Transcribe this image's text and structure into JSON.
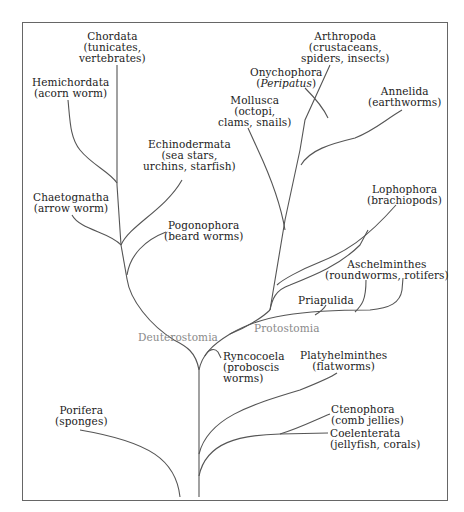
{
  "diagram": {
    "type": "phylogenetic-tree",
    "groups": {
      "deuterostomia": "Deuterostomia",
      "protostomia": "Protostomia"
    },
    "taxa": {
      "chordata": {
        "name": "Chordata",
        "common1": "(tunicates,",
        "common2": "vertebrates)"
      },
      "hemichordata": {
        "name": "Hemichordata",
        "common1": "(acorn worm)"
      },
      "echinodermata": {
        "name": "Echinodermata",
        "common1": "(sea stars,",
        "common2": "urchins, starfish)"
      },
      "chaetognatha": {
        "name": "Chaetognatha",
        "common1": "(arrow worm)"
      },
      "pogonophora": {
        "name": "Pogonophora",
        "common1": "(beard worms)"
      },
      "arthropoda": {
        "name": "Arthropoda",
        "common1": "(crustaceans,",
        "common2": "spiders, insects)"
      },
      "onychophora": {
        "name": "Onychophora",
        "common_open": "(",
        "common_italic": "Peripatus",
        "common_close": ")"
      },
      "mollusca": {
        "name": "Mollusca",
        "common1": "(octopi,",
        "common2": "clams, snails)"
      },
      "annelida": {
        "name": "Annelida",
        "common1": "(earthworms)"
      },
      "lophophora": {
        "name": "Lophophora",
        "common1": "(brachiopods)"
      },
      "aschelminthes": {
        "name": "Aschelminthes",
        "common1": "(roundworms, rotifers)"
      },
      "priapulida": {
        "name": "Priapulida"
      },
      "ryncocoela": {
        "name": "Ryncocoela",
        "common1": "(proboscis",
        "common2": "worms)"
      },
      "platyhelminthes": {
        "name": "Platyhelminthes",
        "common1": "(flatworms)"
      },
      "ctenophora": {
        "name": "Ctenophora",
        "common1": "(comb jellies)"
      },
      "coelenterata": {
        "name": "Coelenterata",
        "common1": "(jellyfish, corals)"
      },
      "porifera": {
        "name": "Porifera",
        "common1": "(sponges)"
      }
    },
    "colors": {
      "line": "#555555",
      "text": "#222222",
      "group_label": "#8a8a8a",
      "frame": "#666666"
    }
  }
}
